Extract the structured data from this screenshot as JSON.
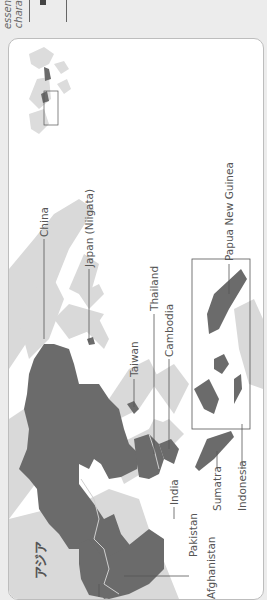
{
  "header": {
    "text_line1": "essen",
    "text_line2": "chara"
  },
  "map": {
    "title": "アジア",
    "orientation": "rotated-90-ccw",
    "colors": {
      "highlight": "#6b6b6b",
      "land": "#d9d9d9",
      "water": "#ffffff",
      "leader_line": "#555555",
      "card_border": "#bdbdbd"
    },
    "labels": [
      {
        "id": "china",
        "text": "China"
      },
      {
        "id": "japan",
        "text": "Japan (Niigata)"
      },
      {
        "id": "taiwan",
        "text": "Taiwan"
      },
      {
        "id": "thailand",
        "text": "Thailand"
      },
      {
        "id": "cambodia",
        "text": "Cambodia"
      },
      {
        "id": "papua",
        "text": "Papua New Guinea"
      },
      {
        "id": "india",
        "text": "India"
      },
      {
        "id": "pakistan",
        "text": "Pakistan"
      },
      {
        "id": "afghanistan",
        "text": "Afghanistan"
      },
      {
        "id": "sumatra",
        "text": "Sumatra"
      },
      {
        "id": "indonesia",
        "text": "Indonesia"
      }
    ],
    "inset": {
      "name": "world-locator",
      "highlight_box": true
    }
  }
}
